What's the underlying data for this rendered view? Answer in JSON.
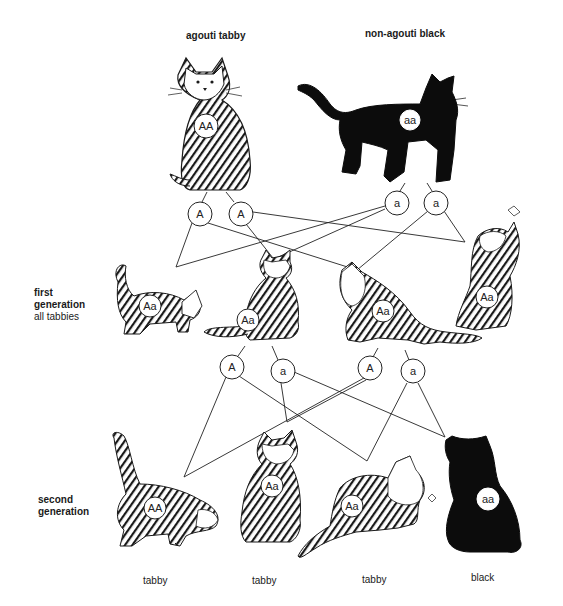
{
  "parents": {
    "left": {
      "label": "agouti tabby",
      "genotype": "AA",
      "phenotype": "tabby",
      "color": "#ffffff"
    },
    "right": {
      "label": "non-agouti black",
      "genotype": "aa",
      "phenotype": "black",
      "color": "#000000"
    }
  },
  "parent_gametes": [
    "A",
    "A",
    "a",
    "a"
  ],
  "first_generation": {
    "title_line1": "first",
    "title_line2": "generation",
    "subtitle": "all tabbies",
    "cats": [
      {
        "genotype": "Aa",
        "phenotype": "tabby"
      },
      {
        "genotype": "Aa",
        "phenotype": "tabby"
      },
      {
        "genotype": "Aa",
        "phenotype": "tabby"
      },
      {
        "genotype": "Aa",
        "phenotype": "tabby"
      }
    ]
  },
  "f1_gametes": [
    "A",
    "a",
    "A",
    "a"
  ],
  "second_generation": {
    "title_line1": "second",
    "title_line2": "generation",
    "cats": [
      {
        "genotype": "AA",
        "phenotype": "tabby"
      },
      {
        "genotype": "Aa",
        "phenotype": "tabby"
      },
      {
        "genotype": "Aa",
        "phenotype": "tabby"
      },
      {
        "genotype": "aa",
        "phenotype": "black"
      }
    ]
  }
}
